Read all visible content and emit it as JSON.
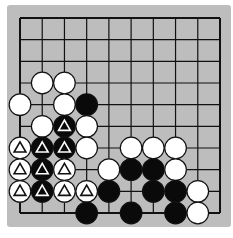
{
  "board": {
    "columns": 10,
    "rows": 10,
    "background": "#bdbdbd",
    "line_color": "#111111",
    "edges": [
      "top",
      "right",
      "bottom",
      "left"
    ]
  },
  "stones": [
    {
      "color": "white",
      "col": 1,
      "row": 3,
      "mark": ""
    },
    {
      "color": "white",
      "col": 2,
      "row": 3,
      "mark": ""
    },
    {
      "color": "white",
      "col": 0,
      "row": 4,
      "mark": ""
    },
    {
      "color": "white",
      "col": 2,
      "row": 4,
      "mark": ""
    },
    {
      "color": "black",
      "col": 3,
      "row": 4,
      "mark": ""
    },
    {
      "color": "white",
      "col": 1,
      "row": 5,
      "mark": ""
    },
    {
      "color": "black",
      "col": 2,
      "row": 5,
      "mark": "triangle"
    },
    {
      "color": "white",
      "col": 3,
      "row": 5,
      "mark": ""
    },
    {
      "color": "white",
      "col": 0,
      "row": 6,
      "mark": "triangle"
    },
    {
      "color": "black",
      "col": 1,
      "row": 6,
      "mark": "triangle"
    },
    {
      "color": "black",
      "col": 2,
      "row": 6,
      "mark": "triangle"
    },
    {
      "color": "white",
      "col": 3,
      "row": 6,
      "mark": ""
    },
    {
      "color": "white",
      "col": 5,
      "row": 6,
      "mark": ""
    },
    {
      "color": "white",
      "col": 6,
      "row": 6,
      "mark": ""
    },
    {
      "color": "white",
      "col": 7,
      "row": 6,
      "mark": ""
    },
    {
      "color": "white",
      "col": 0,
      "row": 7,
      "mark": "triangle"
    },
    {
      "color": "black",
      "col": 1,
      "row": 7,
      "mark": "triangle"
    },
    {
      "color": "white",
      "col": 2,
      "row": 7,
      "mark": "triangle"
    },
    {
      "color": "white",
      "col": 4,
      "row": 7,
      "mark": ""
    },
    {
      "color": "black",
      "col": 5,
      "row": 7,
      "mark": ""
    },
    {
      "color": "black",
      "col": 6,
      "row": 7,
      "mark": ""
    },
    {
      "color": "white",
      "col": 7,
      "row": 7,
      "mark": ""
    },
    {
      "color": "white",
      "col": 0,
      "row": 8,
      "mark": "triangle"
    },
    {
      "color": "black",
      "col": 1,
      "row": 8,
      "mark": "triangle"
    },
    {
      "color": "white",
      "col": 2,
      "row": 8,
      "mark": "triangle"
    },
    {
      "color": "white",
      "col": 3,
      "row": 8,
      "mark": "triangle"
    },
    {
      "color": "black",
      "col": 4,
      "row": 8,
      "mark": ""
    },
    {
      "color": "black",
      "col": 6,
      "row": 8,
      "mark": ""
    },
    {
      "color": "black",
      "col": 7,
      "row": 8,
      "mark": ""
    },
    {
      "color": "white",
      "col": 8,
      "row": 8,
      "mark": ""
    },
    {
      "color": "black",
      "col": 3,
      "row": 9,
      "mark": ""
    },
    {
      "color": "black",
      "col": 5,
      "row": 9,
      "mark": ""
    },
    {
      "color": "black",
      "col": 7,
      "row": 9,
      "mark": ""
    },
    {
      "color": "white",
      "col": 8,
      "row": 9,
      "mark": ""
    }
  ]
}
